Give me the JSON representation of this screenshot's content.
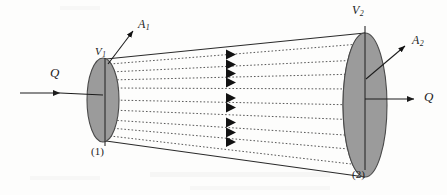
{
  "figure": {
    "background_color": "#fdfdfc",
    "ink_color": "#1c1c1c",
    "disk_fill_color": "#9b9b9b",
    "disk_edge_color": "#4a4a4a",
    "streamline_color": "#555555"
  },
  "labels": {
    "flow_in": "Q",
    "flow_out": "Q",
    "velocity_1_base": "V",
    "velocity_1_sub": "1",
    "velocity_2_base": "V",
    "velocity_2_sub": "2",
    "area_1_base": "A",
    "area_1_sub": "1",
    "area_2_base": "A",
    "area_2_sub": "2",
    "section_1": "(1)",
    "section_2": "(2)"
  },
  "geometry": {
    "section_1": {
      "center_x": 103,
      "center_y": 100,
      "rx": 16,
      "ry": 42
    },
    "section_2": {
      "center_x": 365,
      "center_y": 105,
      "rx": 22,
      "ry": 72
    },
    "streamline_count": 9,
    "arrowhead_x": 232
  }
}
